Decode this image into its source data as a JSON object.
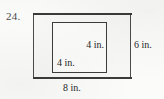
{
  "problem": {
    "number": "24."
  },
  "figure": {
    "type": "nested-rectangles",
    "outer": {
      "name": "outer rectangle",
      "width_label": "8 in.",
      "height_label": "6 in.",
      "width_value": 8,
      "height_value": 6,
      "unit": "in.",
      "fill_color": "#f7f7f6",
      "stroke_color": "#4c4c4c"
    },
    "inner": {
      "name": "inner square",
      "width_label": "4 in.",
      "height_label": "4 in.",
      "width_value": 4,
      "height_value": 4,
      "unit": "in.",
      "fill_color": "#fbfbfa",
      "stroke_color": "#3d3d3d"
    }
  },
  "page": {
    "background_color": "#fbfbfa",
    "ink_color": "#2b2b2b"
  }
}
